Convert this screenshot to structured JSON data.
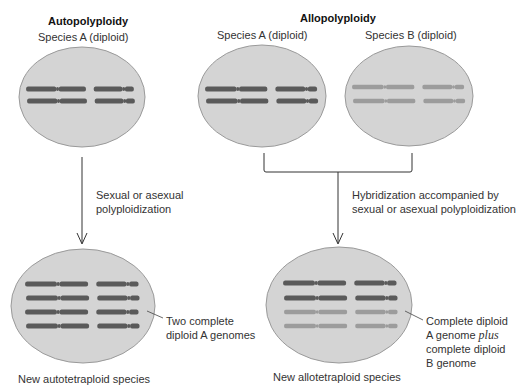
{
  "autopolyploidy": {
    "title": "Autopolyploidy",
    "parent_label": "Species A (diploid)",
    "arrow_label_line1": "Sexual or asexual",
    "arrow_label_line2": "polyploidization",
    "result_annotation_line1": "Two complete",
    "result_annotation_line2": "diploid A genomes",
    "result_label": "New autotetraploid species"
  },
  "allopolyploidy": {
    "title": "Allopolyploidy",
    "parent_a_label": "Species A (diploid)",
    "parent_b_label": "Species B (diploid)",
    "arrow_label_line1": "Hybridization accompanied by",
    "arrow_label_line2": "sexual or asexual polyploidization",
    "result_annotation_line1": "Complete diploid",
    "result_annotation_line2_pre": "A genome ",
    "result_annotation_line2_italic": "plus",
    "result_annotation_line3": "complete diploid",
    "result_annotation_line4": "B genome",
    "result_label": "New allotetraploid species"
  },
  "colors": {
    "cell_fill": "#d4d4d4",
    "cell_stroke": "#9a9a9a",
    "genome_a": "#5a5a5a",
    "genome_b": "#9c9c9c",
    "arrow": "#333333"
  }
}
